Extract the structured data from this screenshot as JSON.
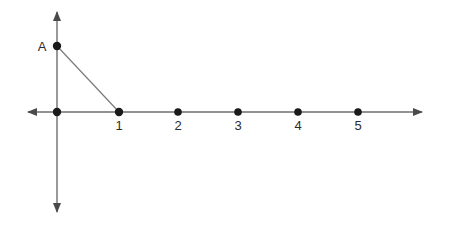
{
  "figure": {
    "background_color": "#ffffff",
    "axis_color": "#6e6e6e",
    "segment_color": "#7a7a7a",
    "point_color": "#1a1a1a",
    "label_color": "#2b2b2b"
  },
  "axes": {
    "x_axis": {
      "name": "horizontal-axis",
      "y": 112,
      "x_start": 28,
      "x_end": 422,
      "arrow_left": true,
      "arrow_right": true
    },
    "y_axis": {
      "name": "vertical-axis",
      "x": 57,
      "y_start": 12,
      "y_end": 212,
      "arrow_up": true,
      "arrow_down": true
    },
    "origin": {
      "x": 57,
      "y": 112
    },
    "unit_spacing_px": 60
  },
  "points": [
    {
      "id": "origin",
      "label": "",
      "x": 57,
      "y": 112,
      "value": 0
    },
    {
      "id": "one",
      "label": "1",
      "x": 119,
      "y": 112,
      "value": 1
    },
    {
      "id": "two",
      "label": "2",
      "x": 178,
      "y": 112,
      "value": 2
    },
    {
      "id": "three",
      "label": "3",
      "x": 238,
      "y": 112,
      "value": 3
    },
    {
      "id": "four",
      "label": "4",
      "x": 298,
      "y": 112,
      "value": 4
    },
    {
      "id": "five",
      "label": "5",
      "x": 358,
      "y": 112,
      "value": 5
    }
  ],
  "tick_labels": {
    "y": 130,
    "items": [
      {
        "text": "1",
        "x": 119
      },
      {
        "text": "2",
        "x": 178
      },
      {
        "text": "3",
        "x": 238
      },
      {
        "text": "4",
        "x": 298
      },
      {
        "text": "5",
        "x": 358
      }
    ]
  },
  "point_a": {
    "label": "A",
    "x": 57,
    "y": 46,
    "label_x": 42,
    "label_y": 51
  },
  "segment": {
    "name": "hypotenuse",
    "from": {
      "x": 57,
      "y": 46
    },
    "to": {
      "x": 119,
      "y": 112
    }
  }
}
